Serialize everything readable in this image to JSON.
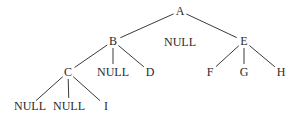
{
  "tree": {
    "nodes": [
      {
        "id": "A",
        "label": "A"
      },
      {
        "id": "B",
        "label": "B",
        "parent": "A"
      },
      {
        "id": "NULL_A",
        "label": "NULL",
        "parent": "A",
        "edge": false
      },
      {
        "id": "E",
        "label": "E",
        "parent": "A"
      },
      {
        "id": "C",
        "label": "C",
        "parent": "B"
      },
      {
        "id": "NULL_B",
        "label": "NULL",
        "parent": "B"
      },
      {
        "id": "D",
        "label": "D",
        "parent": "B"
      },
      {
        "id": "F",
        "label": "F",
        "parent": "E"
      },
      {
        "id": "G",
        "label": "G",
        "parent": "E"
      },
      {
        "id": "H",
        "label": "H",
        "parent": "E"
      },
      {
        "id": "NULL_C1",
        "label": "NULL",
        "parent": "C"
      },
      {
        "id": "NULL_C2",
        "label": "NULL",
        "parent": "C"
      },
      {
        "id": "I",
        "label": "I",
        "parent": "C"
      }
    ]
  }
}
